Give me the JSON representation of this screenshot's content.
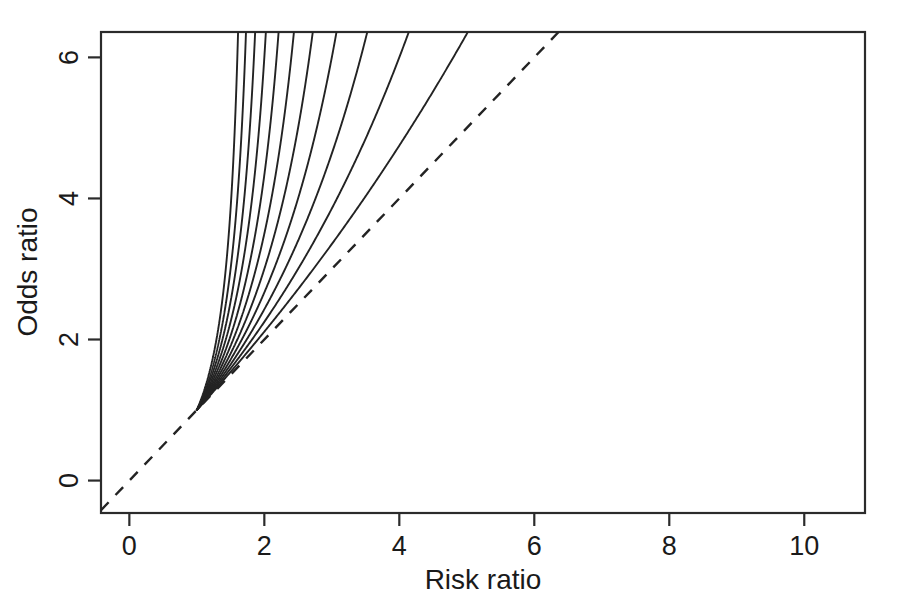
{
  "chart_data": {
    "type": "line",
    "title": "",
    "xlabel": "Risk ratio",
    "ylabel": "Odds ratio",
    "xlim": [
      -0.42,
      10.9
    ],
    "ylim": [
      -0.46,
      6.36
    ],
    "xticks": [
      0,
      2,
      4,
      6,
      8,
      10
    ],
    "xticklabels": [
      "0",
      "2",
      "4",
      "6",
      "8",
      "10"
    ],
    "yticks": [
      0,
      2,
      4,
      6
    ],
    "yticklabels": [
      "0",
      "2",
      "4",
      "6"
    ],
    "grid": false,
    "legend": null,
    "background": "#ffffff",
    "line_color": "#232323",
    "convergence_point": [
      1,
      1
    ],
    "reference_line": {
      "name": "identity",
      "style": "dashed",
      "formula": "OR = RR",
      "x": [
        -0.42,
        6.36
      ],
      "y": [
        -0.42,
        6.36
      ]
    },
    "series": [
      {
        "name": "p0 = 0.05",
        "baseline_risk": 0.05,
        "formula": "OR = RR * (1 - p0) / (1 - RR * p0)",
        "x": [
          1.0,
          1.2,
          1.5,
          2.0,
          2.5,
          3.0,
          3.5,
          4.0,
          4.5,
          5.0,
          5.5,
          5.72
        ],
        "y": [
          1.0,
          1.213,
          1.541,
          2.111,
          2.714,
          3.353,
          4.032,
          4.75,
          5.516,
          6.333,
          7.207,
          7.6
        ]
      },
      {
        "name": "p0 = 0.10",
        "baseline_risk": 0.1,
        "formula": "OR = RR * (1 - p0) / (1 - RR * p0)",
        "x": [
          1.0,
          1.2,
          1.5,
          2.0,
          2.5,
          3.0,
          3.5,
          4.0,
          4.5,
          5.0,
          5.2
        ],
        "y": [
          1.0,
          1.227,
          1.588,
          2.25,
          3.0,
          3.857,
          4.846,
          6.0,
          7.364,
          9.0,
          9.75
        ]
      },
      {
        "name": "p0 = 0.15",
        "baseline_risk": 0.15,
        "formula": "OR = RR * (1 - p0) / (1 - RR * p0)",
        "x": [
          1.0,
          1.2,
          1.5,
          2.0,
          2.5,
          3.0,
          3.5,
          4.0,
          4.5
        ],
        "y": [
          1.0,
          1.243,
          1.64,
          2.414,
          3.4,
          4.696,
          6.489,
          9.158,
          13.6
        ]
      },
      {
        "name": "p0 = 0.20",
        "baseline_risk": 0.2,
        "formula": "OR = RR * (1 - p0) / (1 - RR * p0)",
        "x": [
          1.0,
          1.2,
          1.5,
          2.0,
          2.5,
          3.0,
          3.5,
          4.0
        ],
        "y": [
          1.0,
          1.263,
          1.714,
          2.667,
          4.0,
          6.0,
          9.333,
          16.0
        ]
      },
      {
        "name": "p0 = 0.25",
        "baseline_risk": 0.25,
        "formula": "OR = RR * (1 - p0) / (1 - RR * p0)",
        "x": [
          1.0,
          1.2,
          1.5,
          2.0,
          2.5,
          3.0,
          3.4
        ],
        "y": [
          1.0,
          1.286,
          1.8,
          3.0,
          5.0,
          9.0,
          19.13
        ]
      },
      {
        "name": "p0 = 0.30",
        "baseline_risk": 0.3,
        "formula": "OR = RR * (1 - p0) / (1 - RR * p0)",
        "x": [
          1.0,
          1.2,
          1.5,
          2.0,
          2.5,
          2.9
        ],
        "y": [
          1.0,
          1.313,
          1.909,
          3.5,
          7.0,
          17.29
        ]
      },
      {
        "name": "p0 = 0.35",
        "baseline_risk": 0.35,
        "formula": "OR = RR * (1 - p0) / (1 - RR * p0)",
        "x": [
          1.0,
          1.2,
          1.5,
          2.0,
          2.4,
          2.6
        ],
        "y": [
          1.0,
          1.345,
          2.053,
          4.333,
          10.18,
          17.73
        ]
      },
      {
        "name": "p0 = 0.40",
        "baseline_risk": 0.4,
        "formula": "OR = RR * (1 - p0) / (1 - RR * p0)",
        "x": [
          1.0,
          1.2,
          1.5,
          1.8,
          2.1,
          2.35
        ],
        "y": [
          1.0,
          1.385,
          2.25,
          4.091,
          9.19,
          23.5
        ]
      },
      {
        "name": "p0 = 0.45",
        "baseline_risk": 0.45,
        "formula": "OR = RR * (1 - p0) / (1 - RR * p0)",
        "x": [
          1.0,
          1.2,
          1.4,
          1.7,
          1.95,
          2.12
        ],
        "y": [
          1.0,
          1.434,
          2.09,
          4.44,
          13.1,
          29.0
        ]
      },
      {
        "name": "p0 = 0.50",
        "baseline_risk": 0.5,
        "formula": "OR = RR * (1 - p0) / (1 - RR * p0)",
        "x": [
          1.0,
          1.15,
          1.35,
          1.6,
          1.8,
          1.93
        ],
        "y": [
          1.0,
          1.353,
          2.077,
          4.0,
          9.0,
          27.6
        ]
      },
      {
        "name": "p0 = 0.55",
        "baseline_risk": 0.55,
        "formula": "OR = RR * (1 - p0) / (1 - RR * p0)",
        "x": [
          1.0,
          1.12,
          1.3,
          1.5,
          1.68,
          1.78
        ],
        "y": [
          1.0,
          1.321,
          2.023,
          3.857,
          8.63,
          22.8
        ]
      }
    ]
  },
  "axes": {
    "x_title": "Risk ratio",
    "y_title": "Odds ratio",
    "x_tick_labels": [
      "0",
      "2",
      "4",
      "6",
      "8",
      "10"
    ],
    "y_tick_labels": [
      "0",
      "2",
      "4",
      "6"
    ]
  }
}
